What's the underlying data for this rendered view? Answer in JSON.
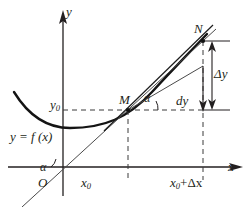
{
  "figure": {
    "background": "#ffffff",
    "ink": "#231f20",
    "curve_color": "#1a1a1a",
    "dash_color": "#3a3a3a",
    "labels": {
      "y_axis": "y",
      "x_axis": "x",
      "origin": "O",
      "y0": "y",
      "y0_sub": "0",
      "x0": "x",
      "x0_sub": "0",
      "x0_plus_dx_main": "x",
      "x0_plus_dx_sub": "0",
      "x0_plus_dx_tail": "+Δx",
      "point_M": "M",
      "point_N": "N",
      "function": "y = f (x)",
      "dy": "dy",
      "delta_y": "Δy",
      "alpha_origin": "α",
      "alpha_at_M": "α"
    },
    "geometry": {
      "origin_px": [
        63,
        167
      ],
      "point_M_px": [
        128,
        110
      ],
      "point_N_px": [
        203,
        41
      ],
      "x0_px": 128,
      "x0_plus_dx_px": 203,
      "y0_px": 110,
      "dy_level_px": 66,
      "curve_min_px": [
        70,
        128
      ],
      "x_axis_y_px": 167,
      "y_axis_x_px": 63
    }
  }
}
